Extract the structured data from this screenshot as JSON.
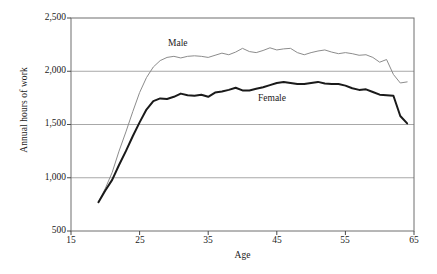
{
  "chart_data": {
    "type": "line",
    "title": "",
    "xlabel": "Age",
    "ylabel": "Annual hours of work",
    "xlim": [
      15,
      65
    ],
    "ylim": [
      500,
      2500
    ],
    "xticks": [
      15,
      25,
      35,
      45,
      55,
      65
    ],
    "yticks": [
      500,
      1000,
      1500,
      2000,
      2500
    ],
    "ytick_labels": [
      "500",
      "1,000",
      "1,500",
      "2,000",
      "2,500"
    ],
    "xtick_labels": [
      "15",
      "25",
      "35",
      "45",
      "55",
      "65"
    ],
    "grid": "horizontal",
    "legend_position": "inline-annotations",
    "x": [
      19,
      20,
      21,
      22,
      23,
      24,
      25,
      26,
      27,
      28,
      29,
      30,
      31,
      32,
      33,
      34,
      35,
      36,
      37,
      38,
      39,
      40,
      41,
      42,
      43,
      44,
      45,
      46,
      47,
      48,
      49,
      50,
      51,
      52,
      53,
      54,
      55,
      56,
      57,
      58,
      59,
      60,
      61,
      62,
      63,
      64
    ],
    "series": [
      {
        "name": "Male",
        "color": "#8c8c8c",
        "width": 1,
        "values": [
          770,
          900,
          1050,
          1250,
          1430,
          1620,
          1800,
          1940,
          2040,
          2100,
          2130,
          2140,
          2125,
          2140,
          2145,
          2140,
          2130,
          2150,
          2170,
          2155,
          2180,
          2215,
          2185,
          2175,
          2195,
          2220,
          2200,
          2210,
          2215,
          2175,
          2155,
          2175,
          2190,
          2200,
          2180,
          2165,
          2175,
          2165,
          2150,
          2155,
          2130,
          2085,
          2110,
          1970,
          1890,
          1900
        ]
      },
      {
        "name": "Female",
        "color": "#1a1a1a",
        "width": 2,
        "values": [
          770,
          880,
          980,
          1120,
          1250,
          1390,
          1520,
          1640,
          1720,
          1745,
          1740,
          1760,
          1790,
          1775,
          1770,
          1780,
          1760,
          1800,
          1810,
          1825,
          1845,
          1820,
          1820,
          1835,
          1850,
          1870,
          1890,
          1900,
          1890,
          1880,
          1880,
          1890,
          1900,
          1885,
          1880,
          1880,
          1865,
          1840,
          1825,
          1830,
          1805,
          1780,
          1775,
          1770,
          1580,
          1510
        ]
      }
    ],
    "annotations": [
      {
        "text": "Male",
        "x": 19.5,
        "y": 2290
      },
      {
        "text": "Female",
        "x": 32.5,
        "y": 1885
      }
    ]
  }
}
